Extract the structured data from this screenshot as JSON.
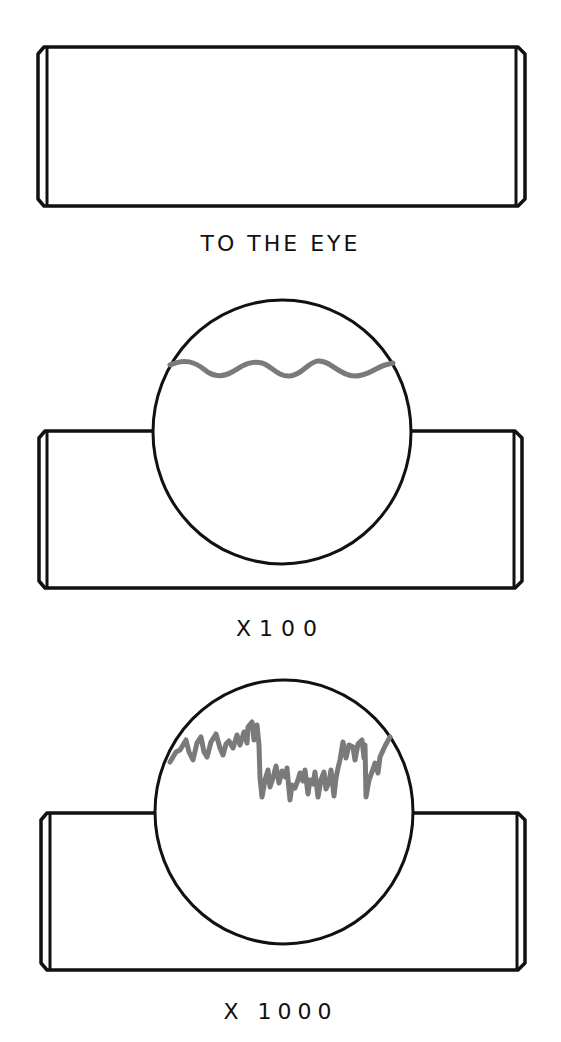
{
  "diagram": {
    "colors": {
      "outline": "#111111",
      "surface_profile": "#7a7a7a",
      "background": "#ffffff"
    },
    "panels": [
      {
        "id": "naked-eye",
        "label": "TO THE EYE",
        "magnifier": false,
        "profile": "none"
      },
      {
        "id": "x100",
        "label": "X100",
        "magnifier": true,
        "profile": "smooth-wave"
      },
      {
        "id": "x1000",
        "label": "X 1000",
        "magnifier": true,
        "profile": "jagged-rough"
      }
    ]
  }
}
